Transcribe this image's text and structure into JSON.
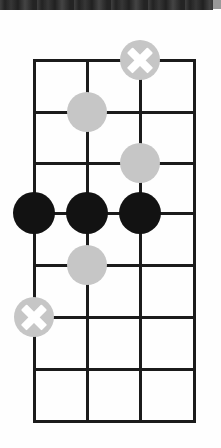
{
  "figure": {
    "kind": "go-board-diagram",
    "background_color": "#fefefe",
    "scan_edge_color": "#2a2a2a",
    "line_color": "#1b1b1b",
    "black_stone_color": "#121212",
    "white_stone_color": "#c6c6c6",
    "mark_color": "#ffffff",
    "caption": ""
  },
  "board": {
    "columns": 4,
    "rows": 8,
    "column_x": [
      34,
      87,
      140,
      194
    ],
    "row_y": [
      60,
      112,
      163,
      213,
      265,
      317,
      369,
      421
    ],
    "line_width": 3
  },
  "stones": [
    {
      "label": "white-stone-marked-c1",
      "color": "white",
      "marked": true,
      "col": 2,
      "row": 0,
      "x": 140,
      "y": 60,
      "radius": 20
    },
    {
      "label": "white-stone-b2",
      "color": "white",
      "marked": false,
      "col": 1,
      "row": 1,
      "x": 87,
      "y": 112,
      "radius": 20
    },
    {
      "label": "white-stone-c3",
      "color": "white",
      "marked": false,
      "col": 2,
      "row": 2,
      "x": 140,
      "y": 163,
      "radius": 20
    },
    {
      "label": "black-stone-a4",
      "color": "black",
      "marked": false,
      "col": 0,
      "row": 3,
      "x": 34,
      "y": 213,
      "radius": 21
    },
    {
      "label": "black-stone-b4",
      "color": "black",
      "marked": false,
      "col": 1,
      "row": 3,
      "x": 87,
      "y": 213,
      "radius": 21
    },
    {
      "label": "black-stone-c4",
      "color": "black",
      "marked": false,
      "col": 2,
      "row": 3,
      "x": 140,
      "y": 213,
      "radius": 21
    },
    {
      "label": "white-stone-b5",
      "color": "white",
      "marked": false,
      "col": 1,
      "row": 4,
      "x": 87,
      "y": 265,
      "radius": 20
    },
    {
      "label": "white-stone-marked-a6",
      "color": "white",
      "marked": true,
      "col": 0,
      "row": 5,
      "x": 34,
      "y": 317,
      "radius": 20
    }
  ]
}
